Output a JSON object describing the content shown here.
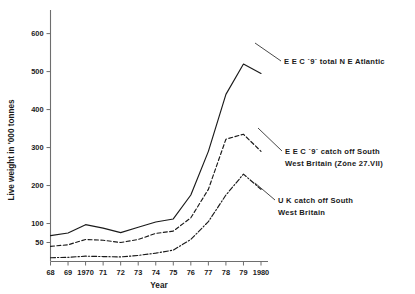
{
  "chart_data": {
    "type": "line",
    "title": "",
    "xlabel": "Year",
    "ylabel": "Live weight in '000 tonnes",
    "x": [
      1968,
      1969,
      1970,
      1971,
      1972,
      1973,
      1974,
      1975,
      1976,
      1977,
      1978,
      1979,
      1980
    ],
    "xtick_labels": [
      "68",
      "69",
      "1970",
      "71",
      "72",
      "73",
      "74",
      "75",
      "76",
      "77",
      "78",
      "79",
      "1980"
    ],
    "ytick_values": [
      50,
      100,
      200,
      300,
      400,
      500,
      600
    ],
    "ytick_labels": [
      "50",
      "100",
      "200",
      "300",
      "400",
      "500",
      "600"
    ],
    "xlim": [
      1968,
      1980
    ],
    "ylim": [
      0,
      620
    ],
    "grid": false,
    "legend_position": "inline-annotations",
    "series": [
      {
        "name": "EEC `9` total N E Atlantic",
        "style": "solid",
        "values": [
          68,
          75,
          97,
          88,
          76,
          90,
          104,
          112,
          175,
          290,
          440,
          520,
          495
        ]
      },
      {
        "name": "EEC `9` catch off South West Britain (Zóne 27.VII)",
        "style": "dashed",
        "values": [
          40,
          44,
          58,
          56,
          50,
          58,
          74,
          80,
          115,
          190,
          322,
          335,
          290
        ]
      },
      {
        "name": "UK catch off South West Britain",
        "style": "dash-dot",
        "values": [
          10,
          11,
          14,
          13,
          12,
          16,
          22,
          30,
          58,
          105,
          175,
          230,
          190
        ]
      }
    ],
    "annotations": [
      {
        "id": "anno-eec-total",
        "lines": [
          "E E C  `9`  total  N E Atlantic"
        ],
        "target_series": "EEC `9` total N E Atlantic"
      },
      {
        "id": "anno-eec-southwest",
        "lines": [
          "E E C `9` catch off  South",
          "West  Britain  (Zóne  27.VII)"
        ],
        "target_series": "EEC `9` catch off South West Britain (Zóne 27.VII)"
      },
      {
        "id": "anno-uk-southwest",
        "lines": [
          "U K  catch  off  South",
          "West  Britain"
        ],
        "target_series": "UK catch off South West Britain"
      }
    ],
    "colors": {
      "line": "#1a1a1a",
      "axis": "#6e6e6e",
      "background": "#ffffff"
    }
  }
}
